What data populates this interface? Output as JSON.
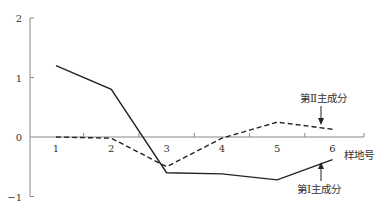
{
  "chart_data": {
    "type": "line",
    "title": "",
    "xlabel": "样地号",
    "ylabel": "",
    "x": [
      1,
      2,
      3,
      4,
      5,
      6
    ],
    "x_tick_labels": [
      "1",
      "2",
      "3",
      "4",
      "5",
      "6"
    ],
    "y_tick_labels": [
      "2",
      "1",
      "0",
      "-1"
    ],
    "ylim": [
      -1,
      2
    ],
    "grid": false,
    "series": [
      {
        "name": "第Ⅰ主成分",
        "style": "solid",
        "values": [
          1.2,
          0.8,
          -0.6,
          -0.62,
          -0.72,
          -0.38
        ]
      },
      {
        "name": "第Ⅱ主成分",
        "style": "dashed",
        "values": [
          0.0,
          -0.02,
          -0.5,
          -0.02,
          0.25,
          0.13
        ]
      }
    ],
    "annotations": [
      {
        "text": "第Ⅱ主成分",
        "target": "series-2",
        "arrow": "down"
      },
      {
        "text": "第Ⅰ主成分",
        "target": "series-1",
        "arrow": "up"
      }
    ]
  }
}
